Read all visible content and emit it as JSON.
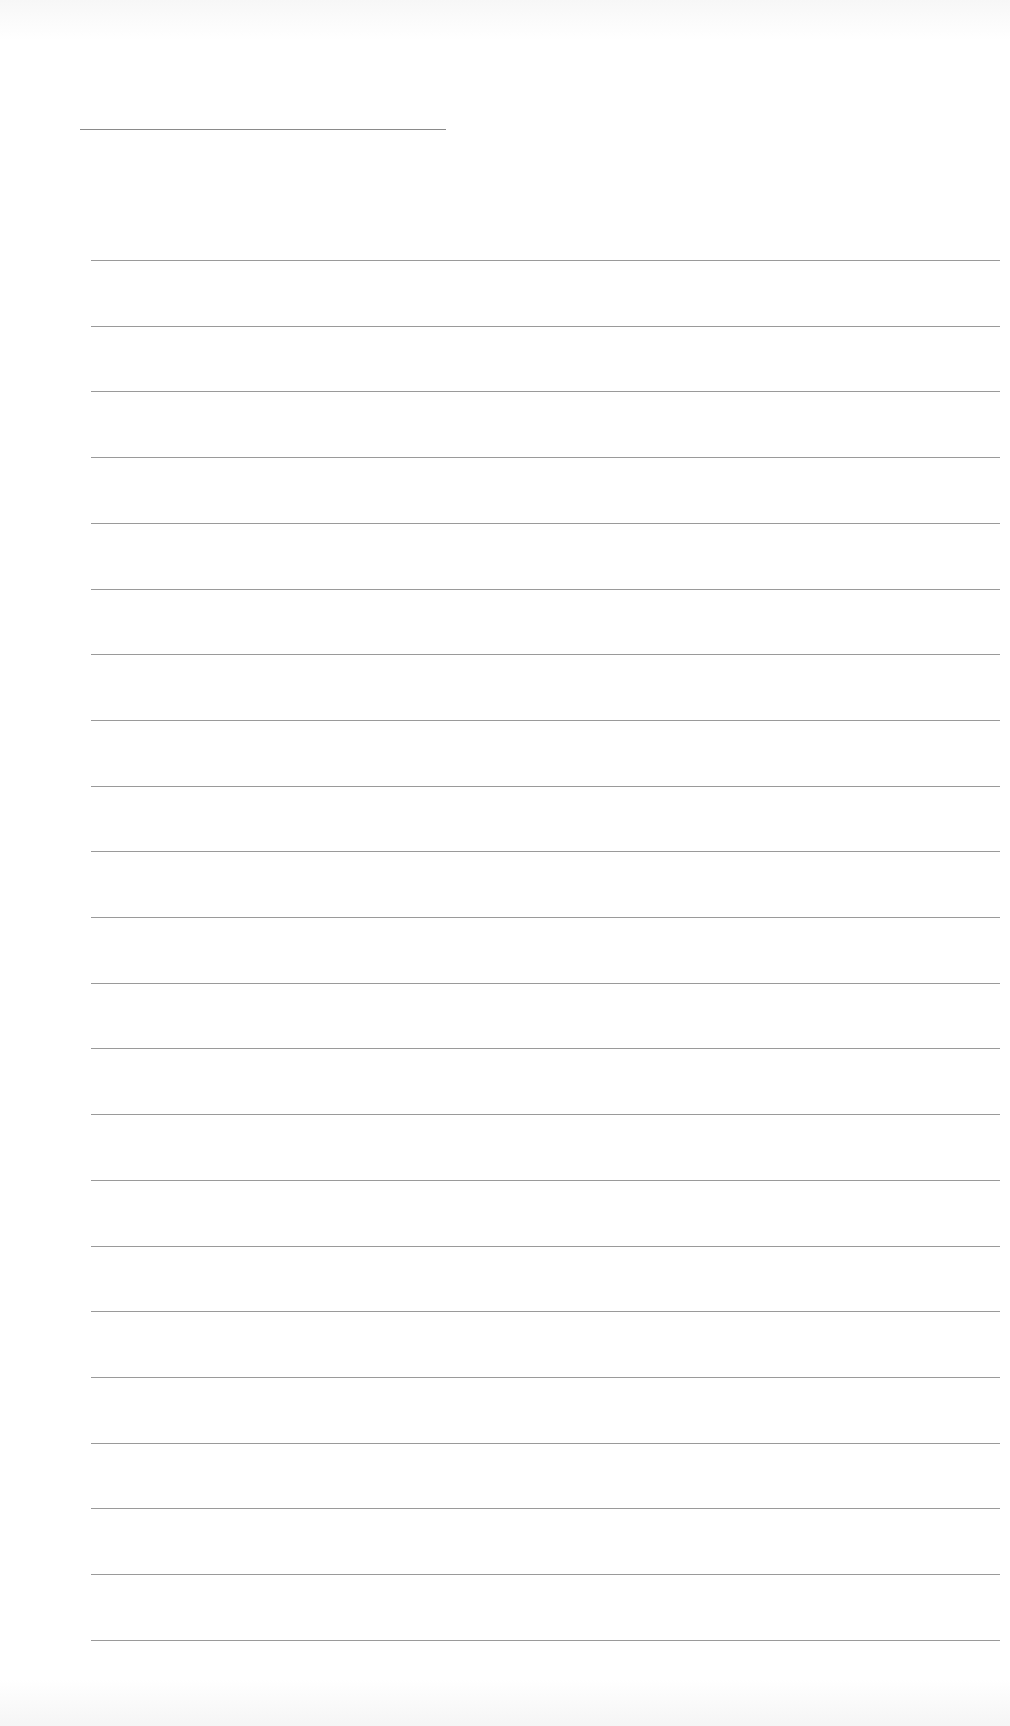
{
  "document": {
    "type": "blank lined page",
    "title_line": {
      "text": ""
    },
    "line_count": 22,
    "line_spacing_px": 65.7,
    "line_color": "#9a9a9a",
    "lines": [
      "",
      "",
      "",
      "",
      "",
      "",
      "",
      "",
      "",
      "",
      "",
      "",
      "",
      "",
      "",
      "",
      "",
      "",
      "",
      "",
      "",
      ""
    ]
  }
}
